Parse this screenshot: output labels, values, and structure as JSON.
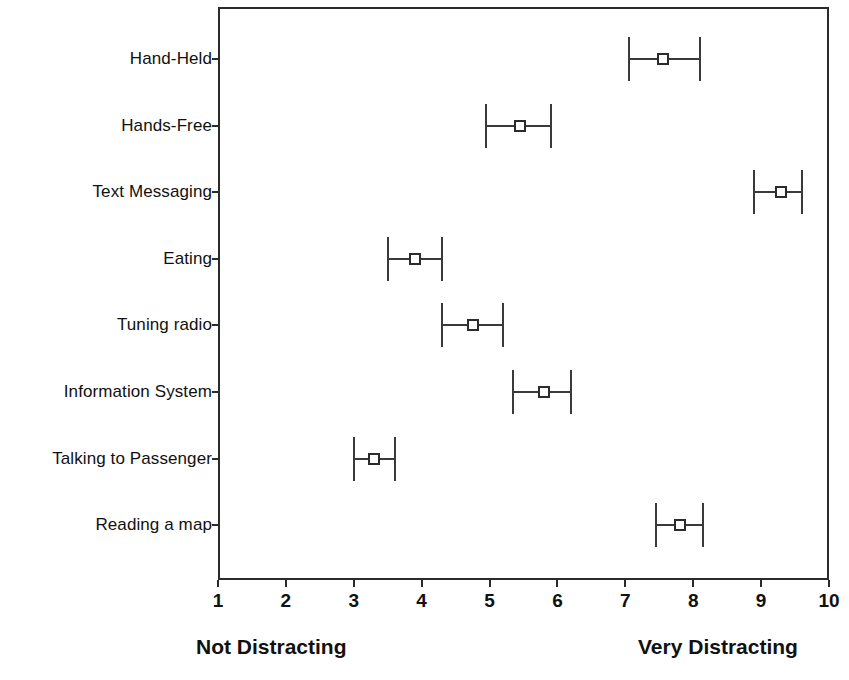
{
  "chart_data": {
    "type": "scatter",
    "title": "",
    "subtitle": "",
    "xlabel": "",
    "ylabel": "",
    "xlim": [
      1,
      10
    ],
    "xticks": [
      "1",
      "2",
      "3",
      "4",
      "5",
      "6",
      "7",
      "8",
      "9",
      "10"
    ],
    "grid": false,
    "legend": null,
    "orientation": "horizontal",
    "error_bars": "confidence-interval",
    "marker_style": "open-square",
    "line_color": "#2b2b2b",
    "categories": [
      "Hand-Held",
      "Hands-Free",
      "Text Messaging",
      "Eating",
      "Tuning radio",
      "Information System",
      "Talking to Passenger",
      "Reading a map"
    ],
    "values": [
      7.55,
      5.45,
      9.3,
      3.9,
      4.75,
      5.8,
      3.3,
      7.8
    ],
    "ci_low": [
      7.05,
      4.95,
      8.9,
      3.5,
      4.3,
      5.35,
      3.0,
      7.45
    ],
    "ci_high": [
      8.1,
      5.9,
      9.6,
      4.3,
      5.2,
      6.2,
      3.6,
      8.15
    ],
    "points": [
      {
        "category": "Hand-Held",
        "mean": 7.55,
        "low": 7.05,
        "high": 8.1
      },
      {
        "category": "Hands-Free",
        "mean": 5.45,
        "low": 4.95,
        "high": 5.9
      },
      {
        "category": "Text Messaging",
        "mean": 9.3,
        "low": 8.9,
        "high": 9.6
      },
      {
        "category": "Eating",
        "mean": 3.9,
        "low": 3.5,
        "high": 4.3
      },
      {
        "category": "Tuning radio",
        "mean": 4.75,
        "low": 4.3,
        "high": 5.2
      },
      {
        "category": "Information System",
        "mean": 5.8,
        "low": 5.35,
        "high": 6.2
      },
      {
        "category": "Talking to Passenger",
        "mean": 3.3,
        "low": 3.0,
        "high": 3.6
      },
      {
        "category": "Reading a map",
        "mean": 7.8,
        "low": 7.45,
        "high": 8.15
      }
    ],
    "annotations": {
      "scale_low_anchor": "Not Distracting",
      "scale_high_anchor": "Very Distracting"
    }
  },
  "axis": {
    "x_anchor_low": "Not Distracting",
    "x_anchor_high": "Very Distracting"
  }
}
